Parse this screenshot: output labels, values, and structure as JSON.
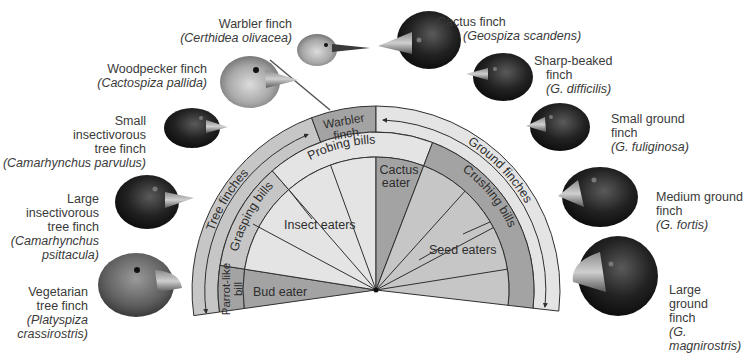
{
  "colors": {
    "light": "#e4e4e4",
    "medium": "#c6c6c6",
    "dark": "#a3a3a3",
    "outline": "#2f2f2f",
    "background": "#ffffff"
  },
  "fan": {
    "outer_ring": {
      "tree_finches": "Tree finches",
      "warbler_finch": [
        "Warbler",
        "finch"
      ],
      "ground_finches": "Ground finches"
    },
    "bill_ring": {
      "grasping": "Grasping bills",
      "probing": "Probing bills",
      "crushing": "Crushing bills",
      "parrot_like": [
        "Parrot-like",
        "bill"
      ]
    },
    "diet": {
      "bud_eater": "Bud eater",
      "insect_eaters": "Insect eaters",
      "cactus_eater": [
        "Cactus",
        "eater"
      ],
      "seed_eaters": "Seed eaters"
    }
  },
  "finches": [
    {
      "id": "warbler",
      "common": [
        "Warbler finch"
      ],
      "scientific": [
        "(Certhidea olivacea)"
      ],
      "head_tone": "light"
    },
    {
      "id": "woodpecker",
      "common": [
        "Woodpecker finch"
      ],
      "scientific": [
        "(Cactospiza pallida)"
      ],
      "head_tone": "light"
    },
    {
      "id": "small-insectivorous-tree",
      "common": [
        "Small",
        "insectivorous",
        "tree finch"
      ],
      "scientific": [
        "(Camarhynchus parvulus)"
      ],
      "head_tone": "dark"
    },
    {
      "id": "large-insectivorous-tree",
      "common": [
        "Large",
        "insectivorous",
        "tree finch"
      ],
      "scientific": [
        "(Camarhynchus",
        "psittacula)"
      ],
      "head_tone": "dark"
    },
    {
      "id": "vegetarian-tree",
      "common": [
        "Vegetarian",
        "tree finch"
      ],
      "scientific": [
        "(Platyspiza",
        "crassirostris)"
      ],
      "head_tone": "medium"
    },
    {
      "id": "cactus",
      "common": [
        "Cactus finch"
      ],
      "scientific": [
        "(Geospiza scandens)"
      ],
      "head_tone": "dark"
    },
    {
      "id": "sharp-beaked",
      "common": [
        "Sharp-beaked",
        "finch"
      ],
      "scientific": [
        "(G. difficilis)"
      ],
      "head_tone": "dark"
    },
    {
      "id": "small-ground",
      "common": [
        "Small ground",
        "finch"
      ],
      "scientific": [
        "(G. fuliginosa)"
      ],
      "head_tone": "dark"
    },
    {
      "id": "medium-ground",
      "common": [
        "Medium ground",
        "finch"
      ],
      "scientific": [
        "(G. fortis)"
      ],
      "head_tone": "dark"
    },
    {
      "id": "large-ground",
      "common": [
        "Large",
        "ground",
        "finch"
      ],
      "scientific": [
        "(G.",
        "magnirostris)"
      ],
      "head_tone": "dark"
    }
  ]
}
